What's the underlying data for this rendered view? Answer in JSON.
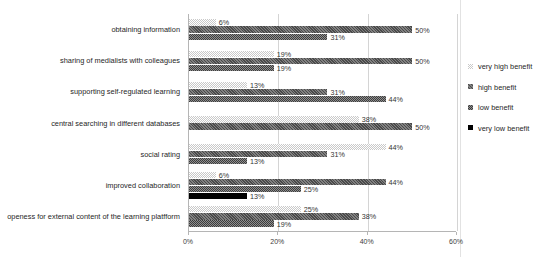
{
  "chart_data": {
    "type": "bar",
    "orientation": "horizontal",
    "title": "",
    "xlabel": "",
    "ylabel": "",
    "xlim": [
      0,
      60
    ],
    "xticks": [
      "0%",
      "20%",
      "40%",
      "60%"
    ],
    "xtick_values": [
      0,
      20,
      40,
      60
    ],
    "grid": true,
    "legend_position": "right",
    "categories": [
      "obtaining information",
      "sharing of medialists with colleagues",
      "supporting self-regulated learning",
      "central searching in different databases",
      "social rating",
      "improved collaboration",
      "openess for external content of the learning platfform"
    ],
    "series": [
      {
        "name": "very high benefit",
        "color": "#c9c9c9",
        "pattern": "light-checker",
        "values": [
          6,
          19,
          13,
          38,
          44,
          6,
          25
        ],
        "labels": [
          "6%",
          "19%",
          "13%",
          "38%",
          "44%",
          "6%",
          "25%"
        ]
      },
      {
        "name": "high benefit",
        "color": "#4a4a4a",
        "pattern": "dark-hatch",
        "values": [
          50,
          50,
          31,
          50,
          31,
          44,
          38
        ],
        "labels": [
          "50%",
          "50%",
          "31%",
          "50%",
          "31%",
          "44%",
          "38%"
        ]
      },
      {
        "name": "low benefit",
        "color": "#8f8f8f",
        "pattern": "gray-checker",
        "values": [
          31,
          19,
          44,
          null,
          13,
          25,
          19
        ],
        "labels": [
          "31%",
          "19%",
          "44%",
          "",
          "13%",
          "25%",
          "19%"
        ]
      },
      {
        "name": "very low benefit",
        "color": "#000000",
        "pattern": "solid",
        "values": [
          null,
          null,
          null,
          null,
          null,
          13,
          null
        ],
        "labels": [
          "",
          "",
          "",
          "",
          "",
          "13%",
          ""
        ]
      }
    ]
  },
  "legend": {
    "items": [
      {
        "label": "very high benefit",
        "swatch": "light-checker-swatch"
      },
      {
        "label": "high benefit",
        "swatch": "dark-hatch-swatch"
      },
      {
        "label": "low benefit",
        "swatch": "gray-checker-swatch"
      },
      {
        "label": "very low benefit",
        "swatch": "solid-black-swatch"
      }
    ]
  }
}
